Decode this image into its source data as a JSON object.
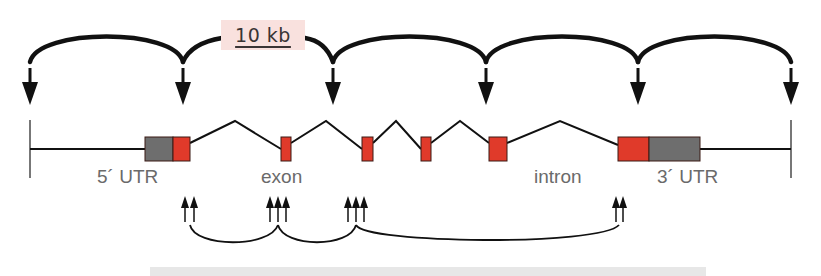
{
  "figure": {
    "type": "gene structure diagram",
    "scale_bar": {
      "label": "10 kb"
    },
    "labels": {
      "five_utr": "5´ UTR",
      "exon": "exon",
      "intron": "intron",
      "three_utr": "3´ UTR"
    },
    "top_arrow_positions_x": [
      30,
      183,
      333,
      486,
      638,
      791
    ],
    "exons": [
      {
        "name": "5' UTR",
        "x": 145,
        "w": 28,
        "color": "#6e6e6e"
      },
      {
        "name": "exon 1",
        "x": 173,
        "w": 17,
        "color": "#e03a2a"
      },
      {
        "name": "exon 2",
        "x": 281,
        "w": 10,
        "color": "#e03a2a"
      },
      {
        "name": "exon 3",
        "x": 362,
        "w": 11,
        "color": "#e03a2a"
      },
      {
        "name": "exon 4",
        "x": 421,
        "w": 10,
        "color": "#e03a2a"
      },
      {
        "name": "exon 5",
        "x": 489,
        "w": 18,
        "color": "#e03a2a"
      },
      {
        "name": "exon 6",
        "x": 618,
        "w": 31,
        "color": "#e03a2a"
      },
      {
        "name": "3' UTR",
        "x": 649,
        "w": 51,
        "color": "#6e6e6e"
      }
    ],
    "bottom_arrow_groups": [
      {
        "count": 2,
        "x": 190
      },
      {
        "count": 3,
        "x": 284
      },
      {
        "count": 3,
        "x": 366
      },
      {
        "count": 2,
        "x": 646
      }
    ],
    "colors": {
      "exon": "#e03a2a",
      "utr": "#6e6e6e",
      "line": "#111111",
      "scale_bg": "#f9e1de"
    }
  }
}
